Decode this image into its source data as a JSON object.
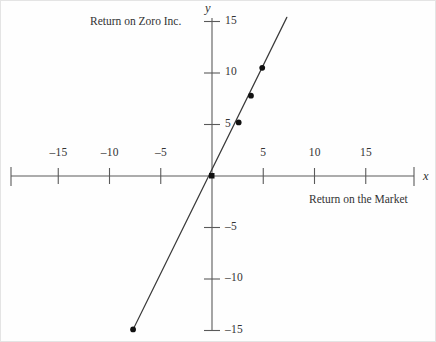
{
  "figure": {
    "width": 436,
    "height": 342,
    "background": "#fefefe",
    "frame_color": "#e4e4e4"
  },
  "labels": {
    "y_axis_symbol": "y",
    "x_axis_symbol": "x",
    "series_title": "Return on Zoro Inc.",
    "x_caption": "Return on the Market"
  },
  "chart_data": {
    "type": "scatter",
    "title": "",
    "subtitle": "",
    "xlabel": "Return on the Market",
    "ylabel": "Return on Zoro Inc.",
    "x_axis_symbol": "x",
    "y_axis_symbol": "y",
    "grid": false,
    "legend": null,
    "xlim": [
      -19,
      19
    ],
    "ylim": [
      -16,
      16
    ],
    "xticks": [
      -15,
      -10,
      -5,
      5,
      10,
      15
    ],
    "yticks": [
      15,
      10,
      5,
      -5,
      -10,
      -15
    ],
    "xtick_labels": [
      "–15",
      "–10",
      "–5",
      "5",
      "10",
      "15"
    ],
    "ytick_labels": [
      "15",
      "10",
      "5",
      "–5",
      "–10",
      "–15"
    ],
    "axis_style": "number-line with end ticks and arrow-free terminals",
    "points": [
      {
        "x": -7.7,
        "y": -14.9
      },
      {
        "x": 2.6,
        "y": 5.2
      },
      {
        "x": 3.8,
        "y": 7.8
      },
      {
        "x": 4.9,
        "y": 10.5
      }
    ],
    "series": [
      {
        "name": "Return on Zoro Inc.",
        "marker": "filled-circle",
        "marker_color": "#111111",
        "x": [
          -7.7,
          2.6,
          3.8,
          4.9
        ],
        "values": [
          -14.9,
          5.2,
          7.8,
          10.5
        ]
      }
    ],
    "trendline": {
      "type": "line",
      "color": "#3a3a3a",
      "x_start": -7.7,
      "y_start": -14.9,
      "x_end": 7.3,
      "y_end": 15.4,
      "slope": 2.0,
      "intercept": 0.0,
      "passes_through_origin": true
    },
    "origin_marker": {
      "x": 0,
      "y": 0,
      "marker": "filled-square"
    }
  }
}
